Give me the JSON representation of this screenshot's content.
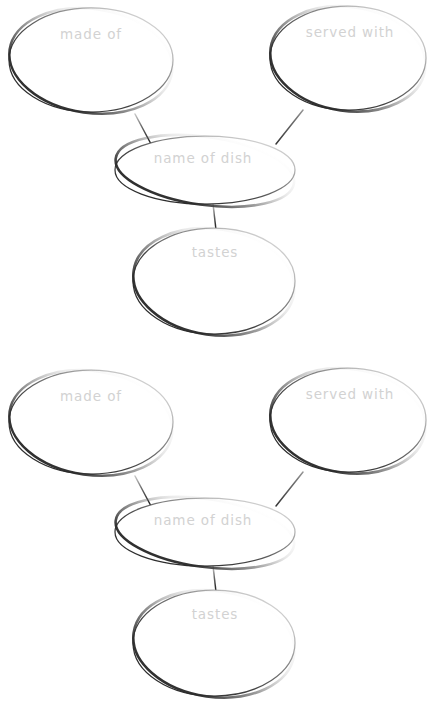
{
  "page": {
    "background_color": "#ffffff",
    "width": 442,
    "height": 724,
    "ink_color": "#3a3a3a",
    "label_color": "#d2d2d2",
    "diagram_count": 2
  },
  "diagrams": [
    {
      "id": "concept-map-1",
      "offset_y": 0,
      "nodes": [
        {
          "id": "made-of-1",
          "name": "made-of",
          "label": "made of",
          "cx": 91,
          "cy": 60,
          "rx": 82,
          "ry": 52,
          "label_x": 91,
          "label_y": 35
        },
        {
          "id": "served-with-1",
          "name": "served-with",
          "label": "served with",
          "cx": 348,
          "cy": 58,
          "rx": 78,
          "ry": 52,
          "label_x": 350,
          "label_y": 33
        },
        {
          "id": "name-of-dish-1",
          "name": "name-of-dish",
          "label": "name of dish",
          "cx": 205,
          "cy": 170,
          "rx": 90,
          "ry": 34,
          "label_x": 203,
          "label_y": 159
        },
        {
          "id": "tastes-1",
          "name": "tastes",
          "label": "tastes",
          "cx": 214,
          "cy": 281,
          "rx": 81,
          "ry": 53,
          "label_x": 215,
          "label_y": 253
        }
      ],
      "connectors": [
        {
          "id": "conn-made-of-1",
          "name": "connector-made-of-to-dish",
          "x1": 135,
          "y1": 114,
          "x2": 151,
          "y2": 144
        },
        {
          "id": "conn-served-with-1",
          "name": "connector-served-with-to-dish",
          "x1": 303,
          "y1": 110,
          "x2": 276,
          "y2": 144
        },
        {
          "id": "conn-tastes-1",
          "name": "connector-dish-to-tastes",
          "x1": 213,
          "y1": 204,
          "x2": 216,
          "y2": 230
        }
      ]
    },
    {
      "id": "concept-map-2",
      "offset_y": 362,
      "nodes": [
        {
          "id": "made-of-2",
          "name": "made-of",
          "label": "made of",
          "cx": 91,
          "cy": 60,
          "rx": 82,
          "ry": 52,
          "label_x": 91,
          "label_y": 35
        },
        {
          "id": "served-with-2",
          "name": "served-with",
          "label": "served with",
          "cx": 348,
          "cy": 58,
          "rx": 78,
          "ry": 52,
          "label_x": 350,
          "label_y": 33
        },
        {
          "id": "name-of-dish-2",
          "name": "name-of-dish",
          "label": "name of dish",
          "cx": 205,
          "cy": 170,
          "rx": 90,
          "ry": 34,
          "label_x": 203,
          "label_y": 159
        },
        {
          "id": "tastes-2",
          "name": "tastes",
          "label": "tastes",
          "cx": 214,
          "cy": 281,
          "rx": 81,
          "ry": 53,
          "label_x": 215,
          "label_y": 253
        }
      ],
      "connectors": [
        {
          "id": "conn-made-of-2",
          "name": "connector-made-of-to-dish",
          "x1": 135,
          "y1": 114,
          "x2": 151,
          "y2": 144
        },
        {
          "id": "conn-served-with-2",
          "name": "connector-served-with-to-dish",
          "x1": 303,
          "y1": 110,
          "x2": 276,
          "y2": 144
        },
        {
          "id": "conn-tastes-2",
          "name": "connector-dish-to-tastes",
          "x1": 213,
          "y1": 204,
          "x2": 216,
          "y2": 230
        }
      ]
    }
  ]
}
